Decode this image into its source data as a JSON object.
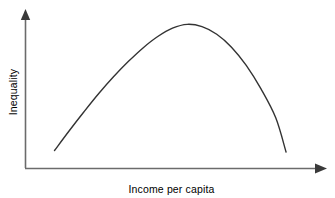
{
  "figure": {
    "background_color": "#ffffff",
    "width": 335,
    "height": 198
  },
  "axes": {
    "x_axis": {
      "name": "income-per-capita-axis",
      "label": "Income per capita",
      "color": "#6b6b6b",
      "arrow_direction": "right"
    },
    "y_axis": {
      "name": "inequality-axis",
      "label": "Inequality",
      "color": "#6b6b6b",
      "arrow_direction": "up",
      "rotation_degrees": -90
    }
  },
  "chart_data": {
    "type": "line",
    "title": "",
    "subtitle": "",
    "xlabel": "Income per capita",
    "ylabel": "Inequality",
    "xlim": [
      0,
      1
    ],
    "ylim": [
      0,
      1
    ],
    "grid": false,
    "legend": "none",
    "axis_ticks": {
      "x_tick_labels": [],
      "y_tick_labels": []
    },
    "annotations": [],
    "series": [
      {
        "name": "Kuznets curve",
        "color": "#333333",
        "line_width": 1.4,
        "shape": "inverted-u",
        "x": [
          0.1,
          0.15,
          0.2,
          0.25,
          0.3,
          0.35,
          0.4,
          0.45,
          0.5,
          0.55,
          0.6,
          0.65,
          0.7,
          0.75,
          0.8,
          0.85,
          0.885
        ],
        "y": [
          0.115,
          0.245,
          0.37,
          0.49,
          0.6,
          0.7,
          0.79,
          0.865,
          0.92,
          0.945,
          0.93,
          0.88,
          0.795,
          0.675,
          0.52,
          0.33,
          0.105
        ]
      }
    ]
  }
}
